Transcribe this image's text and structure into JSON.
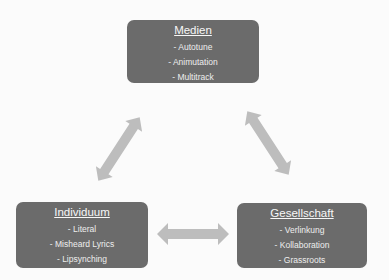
{
  "diagram": {
    "nodes": [
      {
        "id": "medien",
        "title": "Medien",
        "items": [
          "- Autotune",
          "- Animutation",
          "- Multitrack"
        ]
      },
      {
        "id": "individuum",
        "title": "Individuum",
        "items": [
          "- Literal",
          "- Misheard Lyrics",
          "- Lipsynching"
        ]
      },
      {
        "id": "gesellschaft",
        "title": "Gesellschaft",
        "items": [
          "- Verlinkung",
          "- Kollaboration",
          "- Grassroots"
        ]
      }
    ],
    "edges": [
      {
        "from": "medien",
        "to": "individuum",
        "type": "bidirectional-arrow"
      },
      {
        "from": "medien",
        "to": "gesellschaft",
        "type": "bidirectional-arrow"
      },
      {
        "from": "individuum",
        "to": "gesellschaft",
        "type": "bidirectional-arrow"
      }
    ],
    "colors": {
      "box_fill": "#6b6b6b",
      "box_text": "#f4f4f4",
      "arrow_fill": "#bdbdbd",
      "background": "#fbfbfb"
    }
  }
}
